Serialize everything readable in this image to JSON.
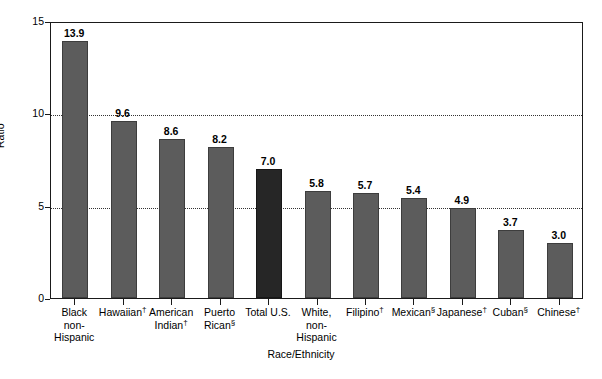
{
  "chart_data": {
    "type": "bar",
    "title": "",
    "xlabel": "Race/Ethnicity",
    "ylabel": "Ratio",
    "ylim": [
      0,
      15
    ],
    "yticks": [
      0,
      5,
      10,
      15
    ],
    "ytick_labels": [
      "0",
      "5",
      "10",
      "15"
    ],
    "gridlines": [
      5,
      10
    ],
    "grid": "horizontal-dotted",
    "legend": "none",
    "categories": [
      "Black non-Hispanic",
      "Hawaiian†",
      "American Indian†",
      "Puerto Rican§",
      "Total U.S.",
      "White, non-Hispanic",
      "Filipino†",
      "Mexican§",
      "Japanese†",
      "Cuban§",
      "Chinese†"
    ],
    "category_lines": [
      [
        "Black",
        "non-",
        "Hispanic"
      ],
      [
        "Hawaiian†"
      ],
      [
        "American",
        "Indian†"
      ],
      [
        "Puerto",
        "Rican§"
      ],
      [
        "Total U.S."
      ],
      [
        "White,",
        "non-",
        "Hispanic"
      ],
      [
        "Filipino†"
      ],
      [
        "Mexican§"
      ],
      [
        "Japanese†"
      ],
      [
        "Cuban§"
      ],
      [
        "Chinese†"
      ]
    ],
    "values": [
      13.9,
      9.6,
      8.6,
      8.2,
      7.0,
      5.8,
      5.7,
      5.4,
      4.9,
      3.7,
      3.0
    ],
    "value_labels": [
      "13.9",
      "9.6",
      "8.6",
      "8.2",
      "7.0",
      "5.8",
      "5.7",
      "5.4",
      "4.9",
      "3.7",
      "3.0"
    ],
    "highlight_index": 4,
    "colors": {
      "bar": "#5c5c5c",
      "bar_edge": "#3d3d3d",
      "bar_highlight": "#262626",
      "bar_highlight_edge": "#161616",
      "axis": "#1a1a1a",
      "grid": "#333333",
      "background": "#ffffff",
      "text": "#000000"
    }
  }
}
